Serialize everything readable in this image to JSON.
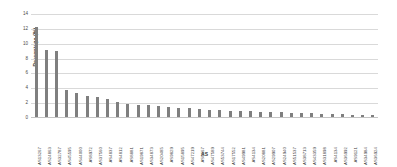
{
  "chart_data": {
    "type": "bar",
    "title": "",
    "xlabel": "AS",
    "ylabel": "Percentage (%)",
    "ylim": [
      0,
      14
    ],
    "ytick_step": 2,
    "yticks": [
      0,
      2,
      4,
      6,
      8,
      10,
      12,
      14
    ],
    "grid": true,
    "legend": false,
    "bar_color": "#7f7f7f",
    "gridline_color": "#d9d9d9",
    "categories": [
      "AS13267",
      "AS24863",
      "AS32787",
      "AS45595",
      "AS44000",
      "AS8972",
      "AS37560",
      "AS4837",
      "AS4812",
      "AS8881",
      "AS19871",
      "AS34873",
      "AS20485",
      "AS9829",
      "AS15895",
      "AS47219",
      "AS8167",
      "AS47589",
      "AS53744",
      "AS17552",
      "AS49981",
      "AS4134",
      "AS20881",
      "AS29907",
      "AS24940",
      "AS51537",
      "AS38713",
      "AS43359",
      "AS31898",
      "AS4134",
      "AS36992",
      "AS9121",
      "AS34984",
      "AS36924"
    ],
    "values": [
      12.2,
      9.1,
      9.0,
      3.8,
      3.4,
      3.0,
      2.8,
      2.5,
      2.2,
      1.9,
      1.8,
      1.7,
      1.6,
      1.5,
      1.4,
      1.3,
      1.2,
      1.1,
      1.05,
      1.0,
      0.95,
      0.9,
      0.85,
      0.8,
      0.75,
      0.7,
      0.68,
      0.65,
      0.6,
      0.55,
      0.5,
      0.45,
      0.4,
      0.35
    ]
  }
}
